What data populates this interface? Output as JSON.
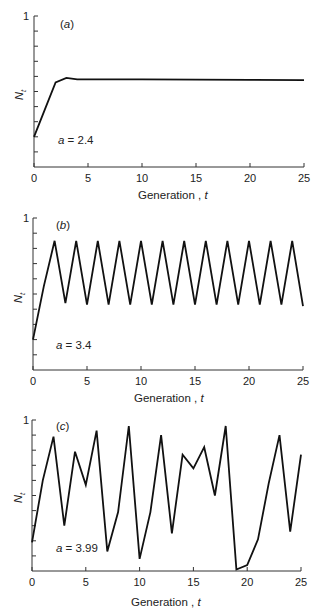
{
  "chart_data": [
    {
      "type": "line",
      "panel_label": "(a)",
      "panel_letter": "a",
      "parameter_label": "a = 2.4",
      "parameter_value": "2.4",
      "xlabel": "Generation , t",
      "xlabel_text": "Generation ,",
      "xlabel_var": "t",
      "ylabel": "N_t",
      "ylabel_main": "N",
      "ylabel_sub": "t",
      "xlim": [
        0,
        25
      ],
      "ylim": [
        0,
        1
      ],
      "xticks": [
        0,
        5,
        10,
        15,
        20,
        25
      ],
      "ytick_labels": [
        "1"
      ],
      "ytick_step": 0.1,
      "grid": false,
      "x": [
        0,
        1,
        2,
        3,
        4,
        5,
        10,
        15,
        20,
        25
      ],
      "values": [
        0.2,
        0.38,
        0.56,
        0.59,
        0.58,
        0.58,
        0.58,
        0.578,
        0.577,
        0.575
      ]
    },
    {
      "type": "line",
      "panel_label": "(b)",
      "panel_letter": "b",
      "parameter_label": "a = 3.4",
      "parameter_value": "3.4",
      "xlabel": "Generation , t",
      "xlabel_text": "Generation ,",
      "xlabel_var": "t",
      "ylabel": "N_t",
      "ylabel_main": "N",
      "ylabel_sub": "t",
      "xlim": [
        0,
        25
      ],
      "ylim": [
        0,
        1
      ],
      "xticks": [
        0,
        5,
        10,
        15,
        20,
        25
      ],
      "ytick_labels": [
        "1"
      ],
      "ytick_step": 0.1,
      "grid": false,
      "x": [
        0,
        1,
        2,
        3,
        4,
        5,
        6,
        7,
        8,
        9,
        10,
        11,
        12,
        13,
        14,
        15,
        16,
        17,
        18,
        19,
        20,
        21,
        22,
        23,
        24,
        25
      ],
      "values": [
        0.2,
        0.55,
        0.85,
        0.44,
        0.85,
        0.43,
        0.85,
        0.43,
        0.85,
        0.43,
        0.85,
        0.43,
        0.85,
        0.43,
        0.85,
        0.43,
        0.85,
        0.43,
        0.85,
        0.43,
        0.85,
        0.43,
        0.85,
        0.43,
        0.85,
        0.42
      ]
    },
    {
      "type": "line",
      "panel_label": "(c)",
      "panel_letter": "c",
      "parameter_label": "a = 3.99",
      "parameter_value": "3.99",
      "xlabel": "Generation , t",
      "xlabel_text": "Generation ,",
      "xlabel_var": "t",
      "ylabel": "N_t",
      "ylabel_main": "N",
      "ylabel_sub": "t",
      "xlim": [
        0,
        25
      ],
      "ylim": [
        0,
        1
      ],
      "xticks": [
        0,
        5,
        10,
        15,
        20,
        25
      ],
      "ytick_labels": [
        "1"
      ],
      "ytick_step": 0.1,
      "grid": false,
      "x": [
        0,
        1,
        2,
        3,
        4,
        5,
        6,
        7,
        8,
        9,
        10,
        11,
        12,
        13,
        14,
        15,
        16,
        17,
        18,
        19,
        20,
        21,
        22,
        23,
        24,
        25
      ],
      "values": [
        0.19,
        0.6,
        0.89,
        0.3,
        0.79,
        0.57,
        0.93,
        0.13,
        0.39,
        0.96,
        0.08,
        0.39,
        0.9,
        0.25,
        0.77,
        0.68,
        0.82,
        0.5,
        0.96,
        0.01,
        0.04,
        0.21,
        0.58,
        0.9,
        0.26,
        0.77
      ]
    }
  ]
}
